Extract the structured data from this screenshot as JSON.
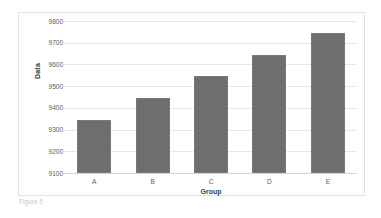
{
  "chart_data": {
    "type": "bar",
    "title": "",
    "xlabel": "Group",
    "ylabel": "Data",
    "categories": [
      "A",
      "B",
      "C",
      "D",
      "E"
    ],
    "values": [
      9345,
      9445,
      9545,
      9645,
      9745
    ],
    "ylim": [
      9100,
      9800
    ],
    "ytick_interval": 100,
    "yticks": [
      9800,
      9700,
      9600,
      9500,
      9400,
      9300,
      9200,
      9100
    ],
    "ytick_labels": [
      "9800",
      "9700",
      "9600",
      "9500",
      "9400",
      "9300",
      "9200",
      "9100"
    ],
    "grid": true,
    "legend": false,
    "legend_position": "none",
    "series": [
      {
        "name": "Data",
        "values": [
          9345,
          9445,
          9545,
          9645,
          9745
        ]
      }
    ],
    "colors": {
      "bar_fill": "#6e6e6e",
      "bar_stroke": "#7a7a7a",
      "gridline": "#e6e6e6",
      "axis_line": "#d4d4d4",
      "tick_text": "#5a5a5a",
      "axis_title_text": "#404040",
      "plot_background": "#ffffff",
      "frame_border": "#e2e2e2",
      "page_background": "#ffffff"
    }
  },
  "caption": {
    "clipped_text": "Figure 5"
  }
}
